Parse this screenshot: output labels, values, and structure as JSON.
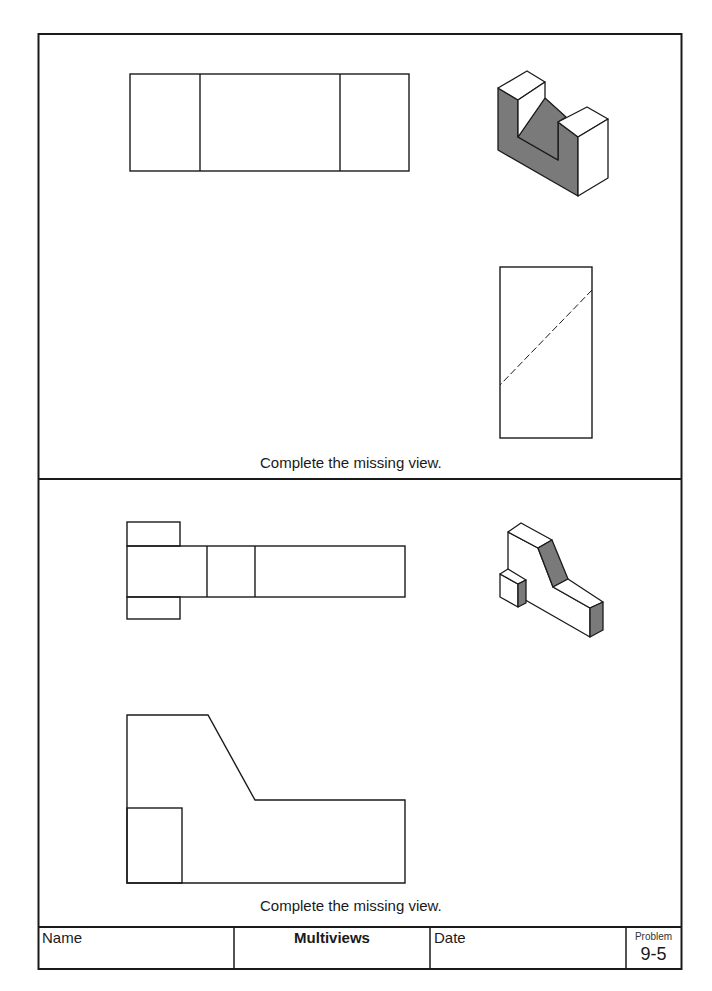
{
  "worksheet": {
    "title": "Multiviews",
    "problem_label": "Problem",
    "problem_number": "9-5"
  },
  "problems": [
    {
      "instruction": "Complete the missing view.",
      "given_views": [
        "top",
        "right-side"
      ],
      "missing_view": "front",
      "pictorial": "isometric U-shaped block with angled notch",
      "colors": {
        "shade": "#7a7a7a",
        "line": "#1a1a1a",
        "face": "#ffffff"
      }
    },
    {
      "instruction": "Complete the missing view.",
      "given_views": [
        "top",
        "front"
      ],
      "missing_view": "right-side",
      "pictorial": "isometric block with sloped face and small cube",
      "colors": {
        "shade": "#7a7a7a",
        "line": "#1a1a1a",
        "face": "#ffffff"
      }
    }
  ],
  "footer": {
    "name_label": "Name",
    "title": "Multiviews",
    "date_label": "Date",
    "problem_label": "Problem",
    "problem_number": "9-5"
  }
}
